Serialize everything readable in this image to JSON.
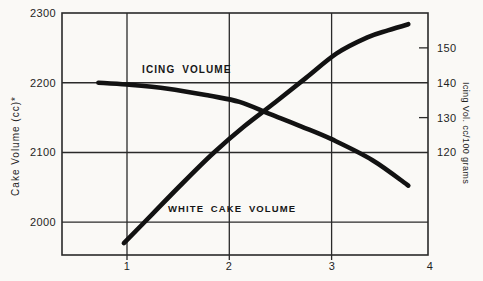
{
  "figure": {
    "background_color": "#faf9f6",
    "ink_color": "#2a2a2a",
    "curve_color": "#121212"
  },
  "chart_data": {
    "type": "line",
    "title": "",
    "x_axis": {
      "tick_labels": [
        "1",
        "2",
        "3",
        "4"
      ],
      "tick_values": [
        1,
        2,
        3,
        4
      ],
      "gridline_values": [
        1,
        2,
        3
      ],
      "range": [
        0.36,
        4
      ]
    },
    "left_axis": {
      "label": "Cake Volume (cc)*",
      "tick_labels": [
        "2300",
        "2200",
        "2100",
        "2000"
      ],
      "tick_values": [
        2300,
        2200,
        2100,
        2000
      ],
      "gridline_values": [
        2200,
        2100,
        2000
      ],
      "max": 2300,
      "min": 1953
    },
    "right_axis": {
      "label": "Icing Vol. cc/100 grams",
      "tick_labels": [
        "150",
        "140",
        "130",
        "120"
      ],
      "tick_values": [
        150,
        140,
        130,
        120
      ],
      "minor_tick_values": [
        150,
        130
      ],
      "max": 160,
      "min": 90.6
    },
    "series": [
      {
        "name": "WHITE CAKE VOLUME",
        "axis": "left",
        "points": [
          [
            0.97,
            1970
          ],
          [
            1.25,
            2012
          ],
          [
            1.55,
            2057
          ],
          [
            1.85,
            2100
          ],
          [
            2.15,
            2138
          ],
          [
            2.45,
            2172
          ],
          [
            2.75,
            2207
          ],
          [
            3.05,
            2242
          ],
          [
            3.35,
            2265
          ],
          [
            3.55,
            2275
          ],
          [
            3.75,
            2284
          ]
        ]
      },
      {
        "name": "ICING VOLUME",
        "axis": "right",
        "points": [
          [
            0.72,
            140
          ],
          [
            1.0,
            139.5
          ],
          [
            1.4,
            138.3
          ],
          [
            1.8,
            136.3
          ],
          [
            2.1,
            134.5
          ],
          [
            2.4,
            131
          ],
          [
            2.7,
            127.5
          ],
          [
            3.0,
            123.8
          ],
          [
            3.4,
            117.8
          ],
          [
            3.75,
            110.5
          ]
        ]
      }
    ]
  }
}
